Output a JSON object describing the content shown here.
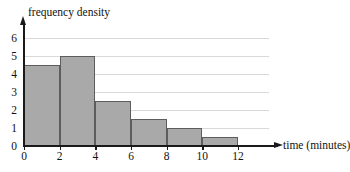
{
  "chart_data": {
    "type": "bar",
    "title": "",
    "xlabel": "time (minutes)",
    "ylabel": "frequency density",
    "xlim": [
      0,
      12
    ],
    "ylim": [
      0,
      6
    ],
    "grid": true,
    "legend": "none",
    "bin_edges": [
      0,
      2,
      4,
      6,
      8,
      10,
      12
    ],
    "categories": [
      "0-2",
      "2-4",
      "4-6",
      "6-8",
      "8-10",
      "10-12"
    ],
    "values": [
      4.5,
      5,
      2.5,
      1.5,
      1,
      0.5
    ],
    "bars": [
      {
        "x0": 0,
        "x1": 2,
        "height": 4.5
      },
      {
        "x0": 2,
        "x1": 4,
        "height": 5
      },
      {
        "x0": 4,
        "x1": 6,
        "height": 2.5
      },
      {
        "x0": 6,
        "x1": 8,
        "height": 1.5
      },
      {
        "x0": 8,
        "x1": 10,
        "height": 1
      },
      {
        "x0": 10,
        "x1": 12,
        "height": 0.5
      }
    ],
    "x_ticks": [
      0,
      2,
      4,
      6,
      8,
      10,
      12
    ],
    "x_tick_labels": [
      "0",
      "2",
      "4",
      "6",
      "8",
      "10",
      "12"
    ],
    "y_ticks": [
      0,
      1,
      2,
      3,
      4,
      5,
      6
    ],
    "y_tick_labels": [
      "0",
      "1",
      "2",
      "3",
      "4",
      "5",
      "6"
    ],
    "gridlines_y": [
      1,
      2,
      3,
      4,
      5,
      6
    ],
    "colors": {
      "bar_fill": "#a9a9a9",
      "bar_stroke": "#5d5d5d",
      "gridline": "#d9d9d9",
      "axis": "#1a1a1a",
      "text": "#121212",
      "background": "#ffffff"
    }
  },
  "axes": {
    "y_axis_label": "frequency density",
    "x_axis_label": "time (minutes)"
  },
  "header": {
    "cropped_title": ""
  }
}
